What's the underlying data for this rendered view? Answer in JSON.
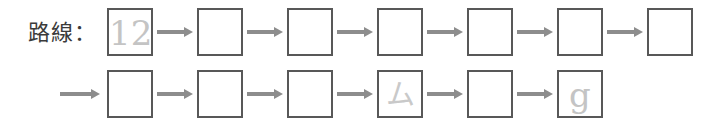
{
  "prompt": {
    "label": "路線：",
    "label_color": "#3b3b3b"
  },
  "colors": {
    "box_border": "#585858",
    "arrow": "#8d8d8d",
    "glyph_faint": "#e4e4e4",
    "background": "#ffffff"
  },
  "sequence": {
    "rows": [
      {
        "leading_arrow": false,
        "cells": [
          {
            "value": "12",
            "kind": "latin",
            "filled": true
          },
          {
            "value": "",
            "kind": "empty",
            "filled": false
          },
          {
            "value": "",
            "kind": "empty",
            "filled": false
          },
          {
            "value": "",
            "kind": "empty",
            "filled": false
          },
          {
            "value": "",
            "kind": "empty",
            "filled": false
          },
          {
            "value": "",
            "kind": "empty",
            "filled": false
          },
          {
            "value": "",
            "kind": "empty",
            "filled": false
          }
        ]
      },
      {
        "leading_arrow": true,
        "cells": [
          {
            "value": "",
            "kind": "empty",
            "filled": false
          },
          {
            "value": "",
            "kind": "empty",
            "filled": false
          },
          {
            "value": "",
            "kind": "empty",
            "filled": false
          },
          {
            "value": "ム",
            "kind": "cjk",
            "filled": true
          },
          {
            "value": "",
            "kind": "empty",
            "filled": false
          },
          {
            "value": "g",
            "kind": "latin",
            "filled": true
          }
        ]
      }
    ],
    "geometry": {
      "first_cell_left": 107,
      "cell_pitch": 90,
      "cell_width": 46,
      "arrow_gap_left_offset": 50,
      "arrow_length": 36,
      "leading_arrow_left": 60,
      "leading_arrow_length": 40
    }
  }
}
